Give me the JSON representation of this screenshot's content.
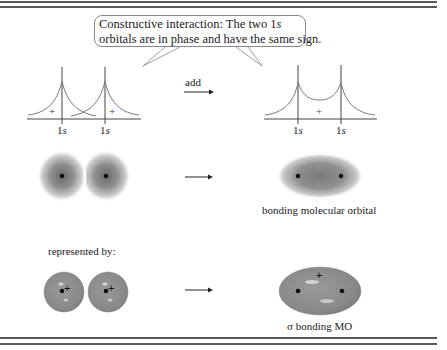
{
  "callout": {
    "line1_prefix": "Constructive interaction:  The two 1",
    "line1_italic": "s",
    "line2": "orbitals are in phase and have the same sign."
  },
  "wavefunctions": {
    "left_labels": [
      {
        "num": "1",
        "italic": "s"
      },
      {
        "num": "1",
        "italic": "s"
      }
    ],
    "left_signs": [
      "+",
      "+"
    ],
    "operation_label": "add",
    "right_labels": [
      {
        "num": "1",
        "italic": "s"
      },
      {
        "num": "1",
        "italic": "s"
      }
    ],
    "right_sign": "+"
  },
  "density_row": {
    "result_caption": "bonding molecular orbital"
  },
  "representation_row": {
    "intro_label": "represented by:",
    "result_caption_symbol": "σ",
    "result_caption": " bonding MO",
    "signs": [
      "+",
      "+",
      "+"
    ]
  },
  "colors": {
    "rule": "#5a5a5a",
    "curve": "#7a7a7a",
    "orbital_fill": "#8c8c8c",
    "cloud_core": "#6e6e6e"
  }
}
